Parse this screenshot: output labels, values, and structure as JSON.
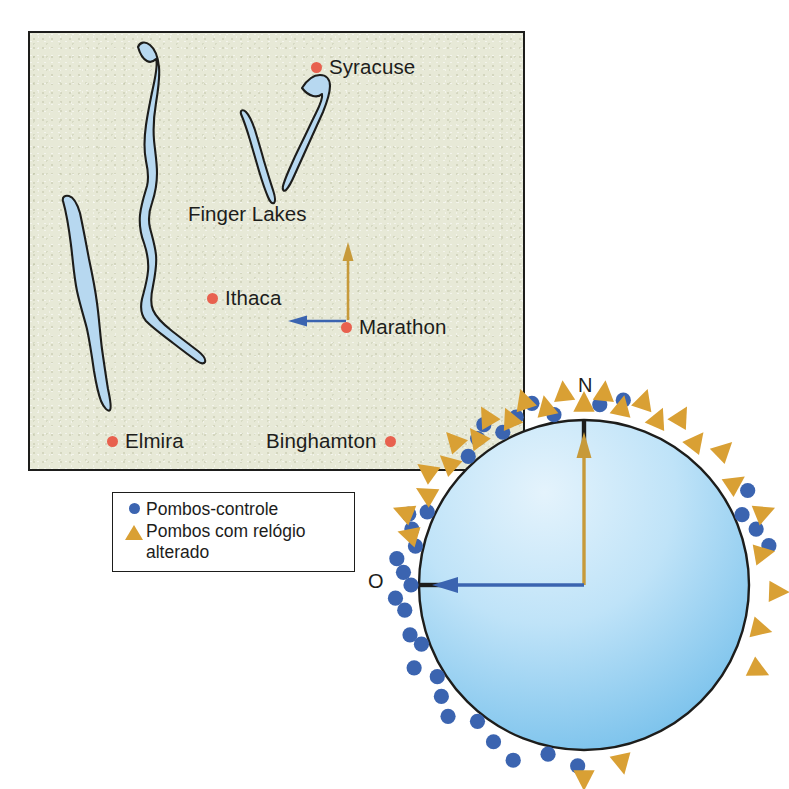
{
  "figure": {
    "domain": "scientific-diagram"
  },
  "map": {
    "background_color": "#e7e9d7",
    "border_color": "#1d1d1b",
    "lake_fill": "#b7d8f0",
    "lake_outline": "#1d1d1b",
    "city_dot_color": "#e8614f",
    "feature_label": "Finger Lakes",
    "cities": [
      {
        "name": "Syracuse",
        "label_side": "right"
      },
      {
        "name": "Ithaca",
        "label_side": "right"
      },
      {
        "name": "Marathon",
        "label_side": "right"
      },
      {
        "name": "Elmira",
        "label_side": "right"
      },
      {
        "name": "Binghamton",
        "label_side": "left"
      }
    ],
    "release_site": "Marathon",
    "arrows": [
      {
        "direction": "north",
        "color": "#c79a3a",
        "meaning": "clock-shifted pigeons mean bearing"
      },
      {
        "direction": "west",
        "color": "#3b64b0",
        "meaning": "control pigeons mean bearing / home direction"
      }
    ]
  },
  "legend": {
    "items": [
      {
        "symbol": "circle",
        "color": "#3b64b0",
        "label": "Pombos-controle"
      },
      {
        "symbol": "triangle",
        "color": "#d9a034",
        "label": "Pombos com relógio alterado"
      }
    ]
  },
  "circle_diagram": {
    "compass_labels": {
      "north": "N",
      "west": "O"
    },
    "ticks": [
      {
        "label": "N",
        "angle_deg": 0
      },
      {
        "label": "O",
        "angle_deg": 270
      }
    ],
    "fill_gradient": {
      "from": "#dcf0fb",
      "to": "#68b9e8"
    },
    "outline_color": "#1d1d1b",
    "vectors": [
      {
        "name": "control-mean-vector",
        "direction": "west",
        "color": "#3b64b0",
        "length_fraction": 0.95
      },
      {
        "name": "clockshift-mean-vector",
        "direction": "north",
        "color": "#c79a3a",
        "length_fraction": 0.92
      }
    ],
    "control_bearings_deg": [
      318,
      324,
      328,
      332,
      338,
      344,
      283,
      288,
      292,
      295,
      262,
      266,
      270,
      274,
      278,
      250,
      254,
      244,
      238,
      232,
      226,
      218,
      210,
      202,
      192,
      182,
      60,
      66,
      72,
      78,
      350,
      5,
      12
    ],
    "clockshift_bearings_deg": [
      300,
      306,
      312,
      318,
      324,
      330,
      336,
      342,
      348,
      354,
      0,
      6,
      12,
      18,
      24,
      30,
      38,
      46,
      56,
      68,
      80,
      92,
      104,
      116,
      168,
      180,
      286,
      292
    ],
    "n_control": 33,
    "n_clockshift": 28
  }
}
